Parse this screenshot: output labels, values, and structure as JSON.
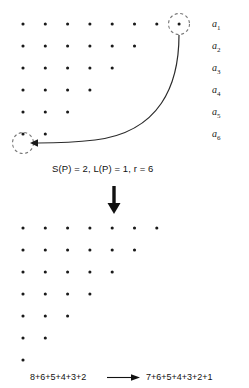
{
  "figure": {
    "background_color": "#ffffff",
    "dot_color": "#1a1a1a",
    "curve_color": "#2b2b2b",
    "dashed_circle_color": "#6f6f6f",
    "arrow_color": "#111111",
    "width": 249,
    "height": 388
  },
  "top_diagram": {
    "name": "top-dot-grid",
    "partition_label": "8+6+5+4+3+2",
    "rows": [
      {
        "label": "a1",
        "label_text": "a",
        "subscript": "1",
        "dots": 8
      },
      {
        "label": "a2",
        "label_text": "a",
        "subscript": "2",
        "dots": 6
      },
      {
        "label": "a3",
        "label_text": "a",
        "subscript": "3",
        "dots": 5
      },
      {
        "label": "a4",
        "label_text": "a",
        "subscript": "4",
        "dots": 4
      },
      {
        "label": "a5",
        "label_text": "a",
        "subscript": "5",
        "dots": 3
      },
      {
        "label": "a6",
        "label_text": "a",
        "subscript": "6",
        "dots": 2
      }
    ],
    "highlight_source": {
      "row": 1,
      "column": 8,
      "style": "dashed-circle"
    },
    "highlight_target": {
      "row": 6,
      "column": 0,
      "style": "dashed-circle-empty"
    },
    "move_arrow": {
      "from": "row1-col8",
      "to": "row6-col0",
      "style": "curved-arrow"
    }
  },
  "caption": {
    "text": "S(P) = 2, L(P) = 1, r = 6",
    "parts": {
      "s_of_p": "S(P) = 2",
      "l_of_p": "L(P) = 1",
      "r_value": "r = 6"
    }
  },
  "transition": {
    "arrow_name": "down-arrow",
    "direction": "down"
  },
  "bottom_diagram": {
    "name": "bottom-dot-grid",
    "partition_label": "7+6+5+4+3+2+1",
    "rows": [
      {
        "dots": 7
      },
      {
        "dots": 6
      },
      {
        "dots": 5
      },
      {
        "dots": 4
      },
      {
        "dots": 3
      },
      {
        "dots": 2
      },
      {
        "dots": 1
      }
    ]
  },
  "formula": {
    "left": "8+6+5+4+3+2",
    "arrow": "⟶",
    "right": "7+6+5+4+3+2+1",
    "full": "8+6+5+4+3+2 ⟶ 7+6+5+4+3+2+1"
  }
}
